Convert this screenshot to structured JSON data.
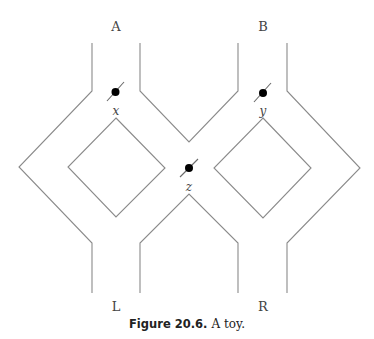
{
  "diagram": {
    "ports": {
      "top_left": "A",
      "top_right": "B",
      "bottom_left": "L",
      "bottom_right": "R"
    },
    "switches": {
      "x": "x",
      "y": "y",
      "z": "z"
    },
    "colors": {
      "wall": "#8a8a8a",
      "dot": "#000000",
      "text": "#444444"
    }
  },
  "caption": {
    "number": "Figure 20.6.",
    "text": "A toy."
  }
}
